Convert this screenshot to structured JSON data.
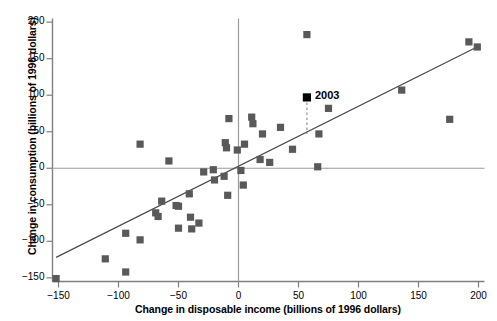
{
  "chart_data": {
    "type": "scatter",
    "title": "",
    "xlabel": "Change in disposable income (billions of 1996 dollars)",
    "ylabel": "Change in consumption (billions of 1996 dollars)",
    "xlim": [
      -155,
      205
    ],
    "ylim": [
      -155,
      205
    ],
    "xticks": [
      -150,
      -100,
      -50,
      0,
      50,
      100,
      150,
      200
    ],
    "xtick_labels": [
      "−150",
      "−100",
      "−50",
      "0",
      "50",
      "100",
      "150",
      "200"
    ],
    "yticks": [
      -150,
      -100,
      -50,
      0,
      50,
      100,
      150,
      200
    ],
    "ytick_labels": [
      "−150",
      "−100",
      "−50",
      "0",
      "50",
      "100",
      "150",
      "200"
    ],
    "grid": false,
    "legend": null,
    "marker_color": "#595959",
    "highlight_color": "#000000",
    "axis_color": "#808080",
    "line_color": "#4d4d4d",
    "points": [
      {
        "x": -152,
        "y": -151
      },
      {
        "x": -111,
        "y": -124
      },
      {
        "x": -94,
        "y": -142
      },
      {
        "x": -94,
        "y": -89
      },
      {
        "x": -82,
        "y": -98
      },
      {
        "x": -82,
        "y": 33
      },
      {
        "x": -69,
        "y": -61
      },
      {
        "x": -67,
        "y": -66
      },
      {
        "x": -64,
        "y": -45
      },
      {
        "x": -58,
        "y": 10
      },
      {
        "x": -52,
        "y": -51
      },
      {
        "x": -50,
        "y": -52
      },
      {
        "x": -50,
        "y": -82
      },
      {
        "x": -41,
        "y": -35
      },
      {
        "x": -40,
        "y": -67
      },
      {
        "x": -39,
        "y": -83
      },
      {
        "x": -33,
        "y": -75
      },
      {
        "x": -29,
        "y": -5
      },
      {
        "x": -21,
        "y": -2
      },
      {
        "x": -20,
        "y": -16
      },
      {
        "x": -12,
        "y": -11
      },
      {
        "x": -11,
        "y": 35
      },
      {
        "x": -10,
        "y": 28
      },
      {
        "x": -9,
        "y": -37
      },
      {
        "x": -8,
        "y": 68
      },
      {
        "x": -1,
        "y": 25
      },
      {
        "x": 2,
        "y": -3
      },
      {
        "x": 4,
        "y": -23
      },
      {
        "x": 5,
        "y": 33
      },
      {
        "x": 11,
        "y": 70
      },
      {
        "x": 12,
        "y": 61
      },
      {
        "x": 18,
        "y": 12
      },
      {
        "x": 20,
        "y": 47
      },
      {
        "x": 26,
        "y": 8
      },
      {
        "x": 35,
        "y": 56
      },
      {
        "x": 45,
        "y": 26
      },
      {
        "x": 57,
        "y": 183
      },
      {
        "x": 66,
        "y": 2
      },
      {
        "x": 67,
        "y": 47
      },
      {
        "x": 75,
        "y": 82
      },
      {
        "x": 136,
        "y": 107
      },
      {
        "x": 176,
        "y": 67
      },
      {
        "x": 192,
        "y": 173
      },
      {
        "x": 199,
        "y": 166
      }
    ],
    "highlight_point": {
      "x": 57,
      "y": 97,
      "label": "2003"
    },
    "highlight_connector": {
      "x": 57,
      "y_from": 97,
      "y_to": 47,
      "style": "dashed"
    },
    "trendline": {
      "x0": -152,
      "y0": -122,
      "x1": 200,
      "y1": 167
    }
  }
}
